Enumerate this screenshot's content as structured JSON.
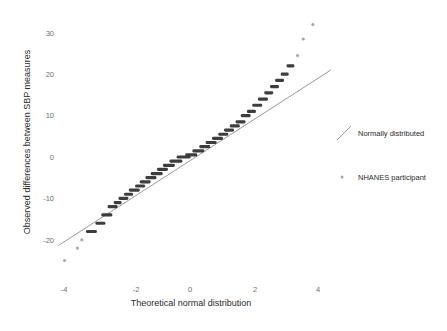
{
  "figure": {
    "background_color": "#ffffff",
    "point_color": "#3d3d3d",
    "outlier_color": "#a8a8a8",
    "line_color": "#9a9a9a",
    "tick_color": "#6e6e6e"
  },
  "axes": {
    "x_title": "Theoretical normal distribution",
    "y_title": "Observed differences between SBP measures",
    "x_ticks": [
      "-4",
      "-2",
      "0",
      "2",
      "4"
    ],
    "y_ticks": [
      "30",
      "20",
      "10",
      "0",
      "-10",
      "-20"
    ]
  },
  "legend": {
    "items": [
      {
        "label": "Normally distributed",
        "marker": "line-glyph",
        "color": "#9a9a9a"
      },
      {
        "label": "NHANES participant",
        "marker": "dot-glyph",
        "color": "#a8a8a8"
      }
    ]
  },
  "chart_data": {
    "type": "scatter",
    "title": "",
    "subtitle": "",
    "xlabel": "Theoretical normal distribution",
    "ylabel": "Observed differences between SBP measures",
    "xlim": [
      -4.6,
      4.8
    ],
    "ylim": [
      -26,
      34
    ],
    "xticks": [
      -4,
      -2,
      0,
      2,
      4
    ],
    "yticks": [
      -20,
      -10,
      0,
      10,
      20,
      30
    ],
    "grid": false,
    "legend_position": "right",
    "annotations": [],
    "series": [
      {
        "name": "NHANES participant",
        "type": "scatter",
        "marker": "dense-band",
        "color": "#3d3d3d",
        "comment": "Q-Q sample quantiles; each band is many tied observations at an integer difference value.",
        "points": [
          {
            "x": -3.92,
            "y": -25.0,
            "width": 2.2,
            "dense": false
          },
          {
            "x": -3.52,
            "y": -22.0,
            "width": 2.2,
            "dense": false
          },
          {
            "x": -3.38,
            "y": -20.0,
            "width": 2.2,
            "dense": false
          },
          {
            "x": -3.08,
            "y": -18.0,
            "width": 11.0,
            "dense": true
          },
          {
            "x": -2.8,
            "y": -16.0,
            "width": 10.0,
            "dense": true
          },
          {
            "x": -2.6,
            "y": -14.0,
            "width": 11.0,
            "dense": true
          },
          {
            "x": -2.42,
            "y": -12.0,
            "width": 10.0,
            "dense": true
          },
          {
            "x": -2.26,
            "y": -11.0,
            "width": 8.0,
            "dense": true
          },
          {
            "x": -2.08,
            "y": -10.0,
            "width": 10.0,
            "dense": true
          },
          {
            "x": -1.92,
            "y": -9.0,
            "width": 9.0,
            "dense": true
          },
          {
            "x": -1.74,
            "y": -8.0,
            "width": 11.0,
            "dense": true
          },
          {
            "x": -1.56,
            "y": -7.0,
            "width": 10.0,
            "dense": true
          },
          {
            "x": -1.4,
            "y": -6.0,
            "width": 11.0,
            "dense": true
          },
          {
            "x": -1.22,
            "y": -5.0,
            "width": 11.0,
            "dense": true
          },
          {
            "x": -1.04,
            "y": -4.0,
            "width": 12.0,
            "dense": true
          },
          {
            "x": -0.86,
            "y": -3.0,
            "width": 11.0,
            "dense": true
          },
          {
            "x": -0.66,
            "y": -2.0,
            "width": 12.0,
            "dense": true
          },
          {
            "x": -0.44,
            "y": -1.0,
            "width": 13.0,
            "dense": true
          },
          {
            "x": -0.2,
            "y": 0.0,
            "width": 14.0,
            "dense": true
          },
          {
            "x": 0.04,
            "y": 0.5,
            "width": 12.0,
            "dense": true
          },
          {
            "x": 0.26,
            "y": 1.5,
            "width": 12.0,
            "dense": true
          },
          {
            "x": 0.46,
            "y": 2.5,
            "width": 11.0,
            "dense": true
          },
          {
            "x": 0.66,
            "y": 3.5,
            "width": 11.0,
            "dense": true
          },
          {
            "x": 0.86,
            "y": 4.5,
            "width": 11.0,
            "dense": true
          },
          {
            "x": 1.04,
            "y": 5.5,
            "width": 10.0,
            "dense": true
          },
          {
            "x": 1.22,
            "y": 6.5,
            "width": 10.0,
            "dense": true
          },
          {
            "x": 1.4,
            "y": 7.5,
            "width": 10.0,
            "dense": true
          },
          {
            "x": 1.58,
            "y": 8.5,
            "width": 10.0,
            "dense": true
          },
          {
            "x": 1.74,
            "y": 10.0,
            "width": 10.0,
            "dense": true
          },
          {
            "x": 1.92,
            "y": 11.0,
            "width": 9.0,
            "dense": true
          },
          {
            "x": 2.1,
            "y": 12.5,
            "width": 10.0,
            "dense": true
          },
          {
            "x": 2.28,
            "y": 14.0,
            "width": 10.0,
            "dense": true
          },
          {
            "x": 2.46,
            "y": 15.5,
            "width": 9.0,
            "dense": true
          },
          {
            "x": 2.64,
            "y": 17.0,
            "width": 9.0,
            "dense": true
          },
          {
            "x": 2.8,
            "y": 18.5,
            "width": 9.0,
            "dense": true
          },
          {
            "x": 2.96,
            "y": 20.0,
            "width": 8.0,
            "dense": true
          },
          {
            "x": 3.14,
            "y": 22.0,
            "width": 8.0,
            "dense": true
          },
          {
            "x": 3.36,
            "y": 24.5,
            "width": 2.2,
            "dense": false
          },
          {
            "x": 3.54,
            "y": 28.5,
            "width": 2.2,
            "dense": false
          },
          {
            "x": 3.84,
            "y": 32.0,
            "width": 2.2,
            "dense": false
          }
        ]
      },
      {
        "name": "Normally distributed",
        "type": "line",
        "color": "#9a9a9a",
        "x": [
          -4.12,
          4.4
        ],
        "y": [
          -21.4,
          21.0
        ]
      }
    ]
  }
}
